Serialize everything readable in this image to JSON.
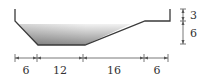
{
  "diagram": {
    "type": "channel-cross-section",
    "colors": {
      "line": "#3a3a3a",
      "dim_line": "#555555",
      "water_top": "#f2f2f2",
      "water_bottom": "#8e8e8e"
    },
    "horizontal_dimensions": [
      {
        "label": "6"
      },
      {
        "label": "12"
      },
      {
        "label": "16"
      },
      {
        "label": "6"
      }
    ],
    "vertical_dimensions": [
      {
        "label": "3"
      },
      {
        "label": "6"
      }
    ]
  }
}
